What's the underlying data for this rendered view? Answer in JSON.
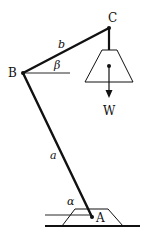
{
  "figure": {
    "type": "mechanics-diagram",
    "colors": {
      "ink": "#111111",
      "background": "#ffffff"
    },
    "points": {
      "A": {
        "label": "A",
        "x": 92,
        "y": 217
      },
      "B": {
        "label": "B",
        "x": 23,
        "y": 73
      },
      "C": {
        "label": "C",
        "x": 109,
        "y": 28
      }
    },
    "bars": [
      {
        "name": "a",
        "label": "a",
        "from": "A",
        "to": "B"
      },
      {
        "name": "b",
        "label": "b",
        "from": "B",
        "to": "C"
      }
    ],
    "angles": [
      {
        "name": "alpha",
        "label": "α",
        "at": "A",
        "description": "angle between bar a and horizontal"
      },
      {
        "name": "beta",
        "label": "β",
        "at": "B",
        "description": "angle between bar b and horizontal"
      }
    ],
    "load": {
      "label": "W",
      "direction": "down"
    }
  }
}
